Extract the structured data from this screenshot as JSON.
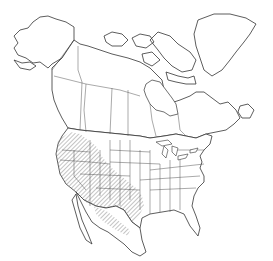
{
  "map": {
    "title": "",
    "region": "North America",
    "projection": "Lambert-like conic",
    "range": {
      "label": "",
      "pattern": "diagonal-hatch",
      "color": "#9a9a9a",
      "areas": [
        "Washington",
        "Oregon",
        "Idaho",
        "California",
        "Nevada",
        "Utah",
        "Arizona",
        "New Mexico",
        "western Colorado",
        "western Wyoming",
        "western Texas",
        "southern British Columbia",
        "northern Mexico"
      ]
    },
    "colors": {
      "background": "#ffffff",
      "outline": "#333333",
      "hatch": "#9a9a9a"
    }
  }
}
